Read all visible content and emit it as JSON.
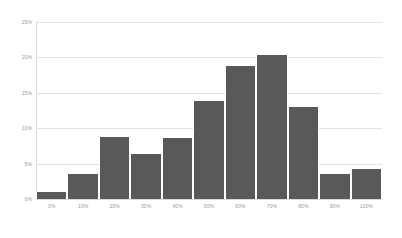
{
  "chart_data": {
    "type": "bar",
    "title": "",
    "subtitle": "",
    "xlabel": "",
    "ylabel": "",
    "categories": [
      "0%",
      "10%",
      "20%",
      "30%",
      "40%",
      "50%",
      "60%",
      "70%",
      "80%",
      "90%",
      "100%"
    ],
    "values": [
      1.0,
      3.6,
      8.8,
      6.3,
      8.6,
      13.8,
      18.8,
      20.3,
      13.0,
      3.5,
      4.2
    ],
    "series": [
      {
        "name": "",
        "values": [
          1.0,
          3.6,
          8.8,
          6.3,
          8.6,
          13.8,
          18.8,
          20.3,
          13.0,
          3.5,
          4.2
        ]
      }
    ],
    "ylim": [
      0,
      25
    ],
    "y_ticks": [
      0,
      5,
      10,
      15,
      20,
      25
    ],
    "y_tick_labels": [
      "0%",
      "5%",
      "10%",
      "15%",
      "20%",
      "25%"
    ],
    "x_tick_labels": [
      "0%",
      "10%",
      "20%",
      "30%",
      "40%",
      "50%",
      "60%",
      "70%",
      "80%",
      "90%",
      "100%"
    ],
    "grid": true,
    "grid_axis": "y",
    "legend": false,
    "legend_position": "none",
    "bar_color": "#595959",
    "gridline_color": "#e2e2e2",
    "axis_color": "#d9d9d9",
    "tick_label_color": "#9a9a9a",
    "background_color": "#ffffff"
  }
}
